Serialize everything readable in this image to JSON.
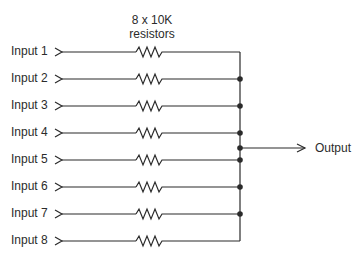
{
  "diagram": {
    "title_line1": "8 x 10K",
    "title_line2": "resistors",
    "inputs": [
      {
        "label": "Input 1",
        "y": 52
      },
      {
        "label": "Input 2",
        "y": 79
      },
      {
        "label": "Input 3",
        "y": 106
      },
      {
        "label": "Input 4",
        "y": 133
      },
      {
        "label": "Input 5",
        "y": 160
      },
      {
        "label": "Input 6",
        "y": 187
      },
      {
        "label": "Input 7",
        "y": 214
      },
      {
        "label": "Input 8",
        "y": 241
      }
    ],
    "output": {
      "label": "Output",
      "y": 148
    },
    "resistor_value": "10K",
    "resistor_count": 8,
    "colors": {
      "line": "#2b2b2b",
      "background": "#ffffff"
    }
  }
}
